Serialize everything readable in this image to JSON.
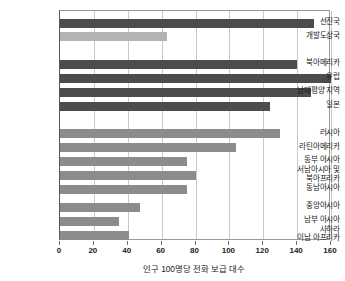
{
  "chart_data": {
    "type": "bar",
    "orientation": "horizontal",
    "title": "",
    "subtitle": "",
    "xlabel": "인구 100명당 전화 보급 대수",
    "ylabel": "",
    "xlim": [
      0,
      160
    ],
    "xticks": [
      0,
      20,
      40,
      60,
      80,
      100,
      120,
      140,
      160
    ],
    "grid": true,
    "legend": "none",
    "categories": [
      "선진국",
      "개발도상국",
      "북아메리카",
      "유럽",
      "남태평양 지역",
      "일본",
      "러시아",
      "라틴아메리카",
      "동부 아시아",
      "서남아시아 및\n북아프리카",
      "동남아시아",
      "중앙아시아",
      "남부 아시아",
      "사하라\n이남 아프리카"
    ],
    "values": [
      150,
      63,
      140,
      160,
      148,
      124,
      130,
      104,
      75,
      80,
      75,
      47,
      35,
      41
    ],
    "bar_colors": [
      "#4c4c4c",
      "#b3b3b3",
      "#4c4c4c",
      "#4c4c4c",
      "#4c4c4c",
      "#4c4c4c",
      "#8c8c8c",
      "#8c8c8c",
      "#8c8c8c",
      "#8c8c8c",
      "#8c8c8c",
      "#8c8c8c",
      "#8c8c8c",
      "#8c8c8c"
    ],
    "colors": {
      "dark_gray": "#4c4c4c",
      "light_gray": "#b3b3b3",
      "medium_gray": "#8c8c8c",
      "gridline": "#c9c9c9",
      "axis": "#6a6a6a",
      "text": "#1b1b1b",
      "background": "#ffffff"
    }
  }
}
